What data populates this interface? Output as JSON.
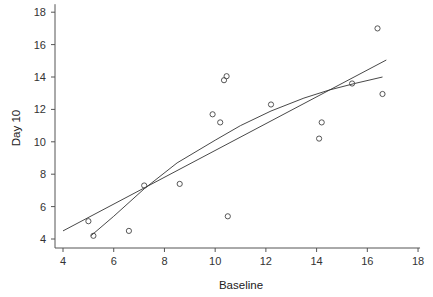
{
  "chart_data": {
    "type": "scatter",
    "title": "",
    "xlabel": "Baseline",
    "ylabel": "Day 10",
    "xlim": [
      4,
      18
    ],
    "ylim": [
      4,
      18
    ],
    "x_ticks": [
      4,
      6,
      8,
      10,
      12,
      14,
      16,
      18
    ],
    "y_ticks": [
      4,
      6,
      8,
      10,
      12,
      14,
      16,
      18
    ],
    "grid": false,
    "legend": null,
    "points": [
      {
        "x": 5.0,
        "y": 5.1
      },
      {
        "x": 5.2,
        "y": 4.2
      },
      {
        "x": 6.6,
        "y": 4.5
      },
      {
        "x": 7.2,
        "y": 7.3
      },
      {
        "x": 8.6,
        "y": 7.4
      },
      {
        "x": 9.9,
        "y": 11.7
      },
      {
        "x": 10.2,
        "y": 11.2
      },
      {
        "x": 10.35,
        "y": 13.8
      },
      {
        "x": 10.45,
        "y": 14.05
      },
      {
        "x": 10.5,
        "y": 5.4
      },
      {
        "x": 12.2,
        "y": 12.3
      },
      {
        "x": 14.1,
        "y": 10.2
      },
      {
        "x": 14.2,
        "y": 11.2
      },
      {
        "x": 15.4,
        "y": 13.6
      },
      {
        "x": 16.4,
        "y": 17.0
      },
      {
        "x": 16.6,
        "y": 12.95
      }
    ],
    "lines": [
      {
        "name": "linear-fit",
        "points": [
          {
            "x": 4.0,
            "y": 4.5
          },
          {
            "x": 16.75,
            "y": 15.05
          }
        ]
      },
      {
        "name": "smooth-fit",
        "points": [
          {
            "x": 5.1,
            "y": 4.2
          },
          {
            "x": 6.0,
            "y": 5.4
          },
          {
            "x": 7.2,
            "y": 7.1
          },
          {
            "x": 8.5,
            "y": 8.7
          },
          {
            "x": 10.0,
            "y": 10.1
          },
          {
            "x": 11.0,
            "y": 11.0
          },
          {
            "x": 12.2,
            "y": 11.9
          },
          {
            "x": 13.5,
            "y": 12.7
          },
          {
            "x": 14.5,
            "y": 13.2
          },
          {
            "x": 15.5,
            "y": 13.6
          },
          {
            "x": 16.6,
            "y": 14.0
          }
        ]
      }
    ]
  },
  "layout": {
    "plot_left": 63,
    "x_unit_px": 25.36,
    "y_base_px": 239,
    "y_unit_px": 16.2
  },
  "colors": {
    "axis": "#555555",
    "line": "#333333",
    "marker": "#444444"
  }
}
